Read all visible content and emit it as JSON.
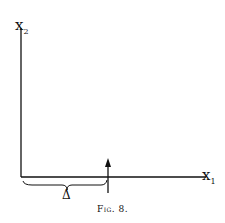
{
  "figure": {
    "caption": "Fig. 8.",
    "y_axis_label": "x",
    "y_axis_subscript": "2",
    "x_axis_label": "x",
    "x_axis_subscript": "1",
    "brace_label": "Δ",
    "stroke_color": "#111111",
    "background": "#ffffff"
  }
}
